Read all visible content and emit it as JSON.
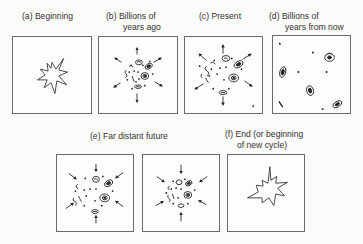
{
  "diagram": {
    "panels": [
      {
        "id": "a",
        "label_line1": "(a) Beginning",
        "label_line2": "",
        "scene": "explosion"
      },
      {
        "id": "b",
        "label_line1": "(b) Billions of",
        "label_line2": "years ago",
        "scene": "expanding-dense-galaxies"
      },
      {
        "id": "c",
        "label_line1": "(c) Present",
        "label_line2": "",
        "scene": "expanding-galaxies"
      },
      {
        "id": "d",
        "label_line1": "(d) Billions of",
        "label_line2": "years from now",
        "scene": "scattered-galaxies"
      },
      {
        "id": "e",
        "label_line1": "(e) Far distant future",
        "label_line2": "",
        "scene": "contracting-galaxies"
      },
      {
        "id": "f",
        "label_line1": "(f) End (or beginning",
        "label_line2": "of new cycle)",
        "scene": "explosion"
      }
    ]
  }
}
